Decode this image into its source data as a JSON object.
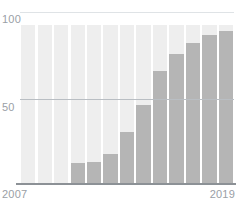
{
  "chart_data": {
    "type": "bar",
    "title": "",
    "subtitle": "",
    "xlabel": "",
    "ylabel": "",
    "ylim": [
      0,
      100
    ],
    "grid": true,
    "legend": false,
    "categories": [
      "2007",
      "2008",
      "2009",
      "2010",
      "2011",
      "2012",
      "2013",
      "2014",
      "2015",
      "2016",
      "2017",
      "2018",
      "2019"
    ],
    "series": [
      {
        "name": "total",
        "values": [
          100,
          100,
          100,
          100,
          100,
          100,
          100,
          100,
          100,
          100,
          100,
          100,
          100
        ]
      },
      {
        "name": "value",
        "values": [
          0,
          0,
          0,
          13,
          14,
          19,
          33,
          50,
          71,
          82,
          89,
          94,
          96
        ]
      }
    ],
    "y_ticks": [
      {
        "value": 100,
        "label": "100"
      },
      {
        "value": 50,
        "label": "50"
      }
    ],
    "x_ticks": [
      {
        "value": "2007",
        "label": "2007"
      },
      {
        "value": "2019",
        "label": "2019"
      }
    ],
    "colors": {
      "background_bar": "#eeeeee",
      "value_bar": "#b5b5b5",
      "gridline_top": "#dfe3e6",
      "gridline_mid": "#b9bec3",
      "axis_line": "#8c9196",
      "tick_label": "#9aa0a6",
      "page_background": "#ffffff"
    }
  }
}
